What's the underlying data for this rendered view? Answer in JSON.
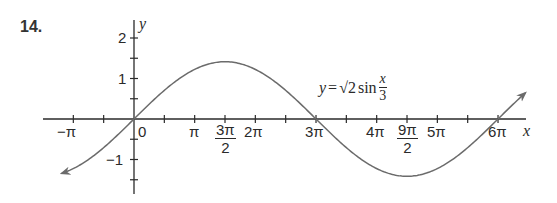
{
  "problem": {
    "number": "14."
  },
  "equation": {
    "lhs": "y",
    "equals": "=",
    "coef": "√2",
    "func": "sin",
    "frac_num": "x",
    "frac_den": "3"
  },
  "axes": {
    "x_label": "x",
    "y_label": "y",
    "x_ticks": [
      {
        "label": "−π"
      },
      {
        "label": "0"
      },
      {
        "label": "π"
      },
      {
        "label_num": "3π",
        "label_den": "2"
      },
      {
        "label": "2π"
      },
      {
        "label": "3π"
      },
      {
        "label": "4π"
      },
      {
        "label_num": "9π",
        "label_den": "2"
      },
      {
        "label": "5π"
      },
      {
        "label": "6π"
      }
    ],
    "y_ticks": [
      {
        "label": "2"
      },
      {
        "label": "1"
      },
      {
        "label": "−1"
      }
    ]
  },
  "colors": {
    "curve": "#6b6b6b",
    "axis": "#2a2a2a",
    "text": "#2a2a2a"
  },
  "chart_data": {
    "type": "line",
    "title": "",
    "function": "y = √2 sin(x/3)",
    "xlabel": "x",
    "ylabel": "y",
    "xlim_pi": [
      -1.5,
      6.5
    ],
    "ylim": [
      -1.9,
      2.4
    ],
    "x_tick_positions_pi": [
      -1,
      -0.5,
      0,
      0.5,
      1,
      1.5,
      2,
      2.5,
      3,
      3.5,
      4,
      4.5,
      5,
      5.5,
      6
    ],
    "x_tick_labels": {
      "-1": "−π",
      "0": "0",
      "1": "π",
      "1.5": "3π/2",
      "2": "2π",
      "3": "3π",
      "4": "4π",
      "4.5": "9π/2",
      "5": "5π",
      "6": "6π"
    },
    "y_tick_positions": [
      -1.5,
      -1,
      -0.5,
      0.5,
      1,
      1.5,
      2
    ],
    "y_tick_labels": {
      "2": "2",
      "1": "1",
      "-1": "−1"
    },
    "key_points": [
      {
        "x": "0",
        "y": 0
      },
      {
        "x": "3π/2",
        "y": 1.414,
        "note": "maximum √2"
      },
      {
        "x": "3π",
        "y": 0
      },
      {
        "x": "9π/2",
        "y": -1.414,
        "note": "minimum −√2"
      },
      {
        "x": "6π",
        "y": 0
      }
    ],
    "amplitude": 1.414,
    "period": "6π",
    "curve_x_range_pi": [
      -1.19,
      6.45
    ],
    "arrows": "both ends",
    "grid": false,
    "legend": "none; equation annotation near curve"
  }
}
